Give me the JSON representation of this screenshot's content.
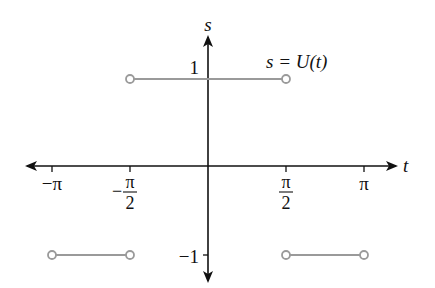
{
  "chart_data": {
    "type": "line",
    "title": "",
    "annotation": "s = U(t)",
    "xlabel": "t",
    "ylabel": "s",
    "xlim": [
      -3.4,
      3.6
    ],
    "ylim": [
      -1.25,
      1.45
    ],
    "grid": false,
    "x_ticks": [
      {
        "value": -3.14159,
        "label": "−π",
        "kind": "plain"
      },
      {
        "value": -1.5708,
        "label_sign": "−",
        "label_num": "π",
        "label_den": "2",
        "kind": "fraction"
      },
      {
        "value": 1.5708,
        "label_sign": "",
        "label_num": "π",
        "label_den": "2",
        "kind": "fraction"
      },
      {
        "value": 3.14159,
        "label": "π",
        "kind": "plain"
      }
    ],
    "y_ticks": [
      {
        "value": 1,
        "label": "1"
      },
      {
        "value": -1,
        "label": "−1"
      }
    ],
    "series": [
      {
        "name": "U(t)",
        "color": "#9a9a9a",
        "segments": [
          {
            "x": [
              -3.14159,
              -1.5708
            ],
            "y": -1,
            "endpoints": [
              "open",
              "open"
            ]
          },
          {
            "x": [
              -1.5708,
              1.5708
            ],
            "y": 1,
            "endpoints": [
              "open",
              "open"
            ]
          },
          {
            "x": [
              1.5708,
              3.14159
            ],
            "y": -1,
            "endpoints": [
              "open",
              "open"
            ]
          }
        ]
      }
    ]
  }
}
